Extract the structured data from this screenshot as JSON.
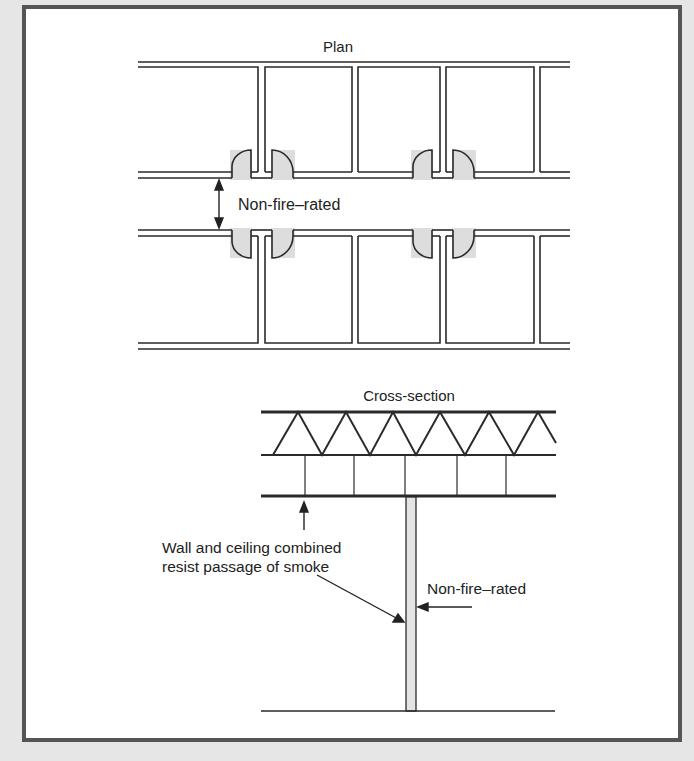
{
  "colors": {
    "background": "#e6e6e6",
    "frame_border": "#555555",
    "line": "#2a2a2a",
    "door_shading": "#dddddd",
    "wall_fill": "#e4e4e4"
  },
  "plan": {
    "title": "Plan",
    "corridor_label": "Non-fire–rated"
  },
  "cross_section": {
    "title": "Cross-section",
    "ceiling_label_line1": "Wall and ceiling combined",
    "ceiling_label_line2": "resist passage of smoke",
    "wall_label": "Non-fire–rated"
  }
}
